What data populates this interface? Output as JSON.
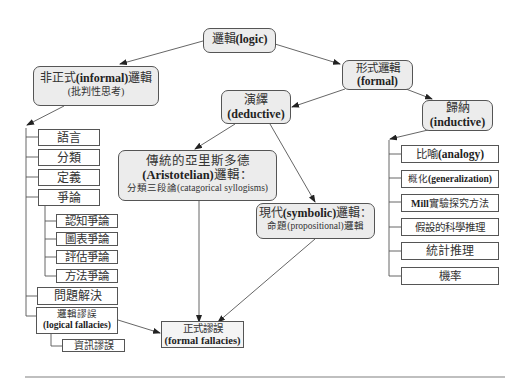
{
  "diagram": {
    "root": {
      "zh": "邏輯",
      "en": "(logic)"
    },
    "informal": {
      "zh_pre": "非正式",
      "en": "(informal)",
      "zh_post": "邏輯",
      "sub": "(批判性思考)"
    },
    "formal": {
      "zh": "形式邏輯",
      "en": "(formal)"
    },
    "deductive": {
      "zh": "演繹",
      "en": "(deductive)"
    },
    "inductive": {
      "zh": "歸納",
      "en": "(inductive)"
    },
    "aristotelian": {
      "zh": "傳統的亞里斯多德",
      "en": "(Aristotelian)",
      "zh_post": "邏輯：",
      "sub": "分類三段論(catagorical syllogisms)"
    },
    "symbolic": {
      "zh_pre": "現代",
      "en": "(symbolic)",
      "zh_post": "邏輯：",
      "sub": "命題(propositional)邏輯"
    },
    "formal_fallacies": {
      "zh": "正式謬誤",
      "en": "(formal fallacies)"
    },
    "informal_items": [
      {
        "label": "語言"
      },
      {
        "label": "分類"
      },
      {
        "label": "定義"
      },
      {
        "label": "爭論"
      }
    ],
    "argument_items": [
      {
        "label": "認知爭論"
      },
      {
        "label": "圖表爭論"
      },
      {
        "label": "評估爭論"
      },
      {
        "label": "方法爭論"
      }
    ],
    "problem_solving": {
      "label": "問題解決"
    },
    "logical_fallacies": {
      "zh": "邏輯謬誤",
      "en": "(logical fallacies)"
    },
    "info_fallacy": {
      "label": "資訊謬誤"
    },
    "inductive_items": [
      {
        "zh": "比喻",
        "en": "(analogy)"
      },
      {
        "zh": "概化",
        "en": "(generalization)"
      },
      {
        "en": "Mill",
        "zh": "實驗探究方法"
      },
      {
        "zh": "假設的科學推理"
      },
      {
        "zh": "統計推理"
      },
      {
        "zh": "機率"
      }
    ]
  },
  "colors": {
    "node_fill": "#ececec",
    "border": "#555555",
    "line": "#555555",
    "rule": "#aaaaaa"
  }
}
